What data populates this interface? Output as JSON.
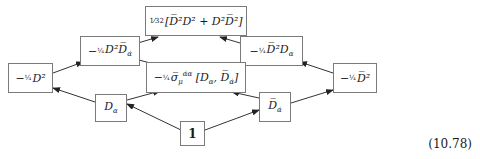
{
  "diagram": {
    "nodes": {
      "top": "1⁄32 [D̅²D² + D²D̅²]",
      "mid_left": "− ¼ D²D̅ α̇",
      "mid_right": "− ¼ D̅²Dα",
      "middle": "− ¼ σ̅μ^{α̇α} [Dα, D̅α̇]",
      "far_left": "− ¼ D²",
      "far_right": "− ¼ D̅²",
      "d_alpha": "Dα",
      "dbar_alphadot": "D̅α̇",
      "one": "1"
    },
    "arrows": [
      {
        "from": "one",
        "to": "d_alpha"
      },
      {
        "from": "one",
        "to": "dbar_alphadot"
      },
      {
        "from": "d_alpha",
        "to": "far_left"
      },
      {
        "from": "d_alpha",
        "to": "middle"
      },
      {
        "from": "dbar_alphadot",
        "to": "far_right"
      },
      {
        "from": "dbar_alphadot",
        "to": "middle"
      },
      {
        "from": "far_left",
        "to": "mid_left"
      },
      {
        "from": "far_right",
        "to": "mid_right"
      },
      {
        "from": "mid_left",
        "to": "top"
      },
      {
        "from": "mid_right",
        "to": "top"
      },
      {
        "from": "middle",
        "to": "mid_left"
      },
      {
        "from": "middle",
        "to": "mid_right"
      }
    ]
  },
  "equation_number": "(10.78)"
}
